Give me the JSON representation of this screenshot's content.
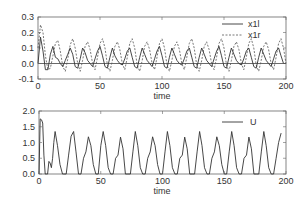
{
  "chart_data": [
    {
      "type": "line",
      "title": "",
      "xlabel": "time",
      "ylabel": "",
      "xlim": [
        0,
        200
      ],
      "ylim": [
        -0.1,
        0.3
      ],
      "x_ticks": [
        "0",
        "50",
        "100",
        "150",
        "200"
      ],
      "y_ticks": [
        "-0.1",
        "0.0",
        "0.1",
        "0.2",
        "0.3"
      ],
      "grid": false,
      "zero_line": true,
      "legend_position": "upper right",
      "series": [
        {
          "name": "x1l",
          "style": "solid",
          "x": [
            0,
            2,
            4,
            6,
            8,
            10,
            12,
            14,
            16,
            18,
            20,
            22,
            24,
            26,
            28,
            30,
            32,
            34,
            36,
            38,
            40,
            42,
            44,
            46,
            48,
            50,
            52,
            54,
            56,
            58,
            60,
            62,
            64,
            66,
            68,
            70,
            72,
            74,
            76,
            78,
            80,
            82,
            84,
            86,
            88,
            90,
            92,
            94,
            96,
            98,
            100,
            102,
            104,
            106,
            108,
            110,
            112,
            114,
            116,
            118,
            120,
            122,
            124,
            126,
            128,
            130,
            132,
            134,
            136,
            138,
            140,
            142,
            144,
            146,
            148,
            150,
            152,
            154,
            156,
            158,
            160,
            162,
            164,
            166,
            168,
            170,
            172,
            174,
            176,
            178,
            180,
            182,
            184,
            186,
            188,
            190,
            192,
            194,
            196,
            198,
            200
          ],
          "y": [
            0.0,
            0.17,
            0.08,
            -0.04,
            -0.04,
            0.06,
            0.11,
            0.04,
            0.03,
            0.0,
            -0.02,
            0.02,
            0.06,
            0.1,
            0.06,
            -0.02,
            -0.03,
            0.03,
            0.1,
            0.07,
            0.02,
            0.0,
            -0.02,
            0.03,
            0.08,
            0.11,
            0.05,
            -0.02,
            -0.03,
            0.04,
            0.1,
            0.05,
            0.02,
            0.0,
            -0.01,
            0.03,
            0.08,
            0.1,
            0.04,
            -0.02,
            -0.03,
            0.04,
            0.1,
            0.06,
            0.02,
            0.0,
            -0.02,
            0.03,
            0.08,
            0.11,
            0.05,
            -0.02,
            -0.03,
            0.04,
            0.1,
            0.06,
            0.02,
            0.0,
            -0.01,
            0.03,
            0.08,
            0.1,
            0.04,
            -0.02,
            -0.03,
            0.04,
            0.1,
            0.06,
            0.02,
            0.0,
            -0.02,
            0.03,
            0.08,
            0.11,
            0.05,
            -0.02,
            -0.03,
            0.04,
            0.1,
            0.06,
            0.02,
            0.0,
            -0.01,
            0.03,
            0.08,
            0.1,
            0.04,
            -0.02,
            -0.03,
            0.04,
            0.1,
            0.06,
            0.02,
            0.0,
            -0.02,
            0.03,
            0.08,
            0.1,
            0.05,
            0.0,
            0.0
          ]
        },
        {
          "name": "x1r",
          "style": "dashed",
          "x": [
            0,
            2,
            4,
            6,
            8,
            10,
            12,
            14,
            16,
            18,
            20,
            22,
            24,
            26,
            28,
            30,
            32,
            34,
            36,
            38,
            40,
            42,
            44,
            46,
            48,
            50,
            52,
            54,
            56,
            58,
            60,
            62,
            64,
            66,
            68,
            70,
            72,
            74,
            76,
            78,
            80,
            82,
            84,
            86,
            88,
            90,
            92,
            94,
            96,
            98,
            100,
            102,
            104,
            106,
            108,
            110,
            112,
            114,
            116,
            118,
            120,
            122,
            124,
            126,
            128,
            130,
            132,
            134,
            136,
            138,
            140,
            142,
            144,
            146,
            148,
            150,
            152,
            154,
            156,
            158,
            160,
            162,
            164,
            166,
            168,
            170,
            172,
            174,
            176,
            178,
            180,
            182,
            184,
            186,
            188,
            190,
            192,
            194,
            196,
            198,
            200
          ],
          "y": [
            0.1,
            0.25,
            0.2,
            0.05,
            -0.04,
            -0.03,
            0.05,
            0.13,
            0.15,
            0.08,
            -0.02,
            -0.05,
            0.03,
            0.12,
            0.16,
            0.1,
            0.0,
            -0.05,
            0.02,
            0.11,
            0.14,
            0.09,
            0.0,
            -0.04,
            0.04,
            0.13,
            0.16,
            0.1,
            -0.01,
            -0.05,
            0.02,
            0.11,
            0.14,
            0.09,
            0.0,
            -0.04,
            0.04,
            0.13,
            0.16,
            0.1,
            -0.01,
            -0.05,
            0.02,
            0.11,
            0.14,
            0.09,
            0.0,
            -0.04,
            0.04,
            0.13,
            0.16,
            0.1,
            -0.01,
            -0.05,
            0.02,
            0.11,
            0.14,
            0.09,
            0.0,
            -0.04,
            0.04,
            0.13,
            0.16,
            0.1,
            -0.01,
            -0.05,
            0.02,
            0.11,
            0.14,
            0.09,
            0.0,
            -0.04,
            0.04,
            0.13,
            0.16,
            0.1,
            -0.01,
            -0.05,
            0.02,
            0.11,
            0.14,
            0.09,
            0.0,
            -0.04,
            0.04,
            0.13,
            0.16,
            0.1,
            -0.01,
            -0.05,
            0.02,
            0.11,
            0.14,
            0.09,
            0.0,
            -0.04,
            0.04,
            0.13,
            0.16,
            0.1,
            0.0
          ]
        }
      ]
    },
    {
      "type": "line",
      "title": "",
      "xlabel": "time",
      "ylabel": "",
      "xlim": [
        0,
        200
      ],
      "ylim": [
        0.0,
        2.0
      ],
      "x_ticks": [
        "0",
        "50",
        "100",
        "150",
        "200"
      ],
      "y_ticks": [
        "0.0",
        "0.5",
        "1.0",
        "1.5",
        "2.0"
      ],
      "grid": false,
      "legend_position": "upper right",
      "series": [
        {
          "name": "U",
          "style": "solid",
          "x": [
            0,
            1,
            2,
            3,
            4,
            5,
            6,
            7,
            8,
            9,
            10,
            11,
            12,
            13,
            15,
            17,
            19,
            20,
            22,
            24,
            26,
            28,
            30,
            32,
            34,
            36,
            38,
            40,
            42,
            44,
            46,
            48,
            50,
            52,
            54,
            56,
            58,
            60,
            62,
            64,
            66,
            68,
            70,
            72,
            74,
            76,
            78,
            80,
            82,
            84,
            86,
            88,
            90,
            92,
            94,
            96,
            98,
            100,
            102,
            104,
            106,
            108,
            110,
            112,
            114,
            116,
            118,
            120,
            122,
            124,
            126,
            128,
            130,
            132,
            134,
            136,
            138,
            140,
            142,
            144,
            146,
            148,
            150,
            152,
            154,
            156,
            158,
            160,
            162,
            164,
            166,
            168,
            170,
            172,
            174,
            176,
            178,
            180,
            182,
            184,
            186,
            188,
            190,
            192,
            194,
            196,
            198,
            200
          ],
          "y": [
            0.0,
            1.75,
            1.72,
            1.62,
            0.6,
            0.0,
            0.0,
            0.0,
            0.4,
            0.35,
            0.2,
            0.5,
            1.0,
            1.35,
            0.9,
            0.3,
            0.0,
            0.0,
            0.0,
            0.6,
            1.2,
            1.35,
            0.7,
            0.0,
            0.0,
            0.5,
            0.7,
            1.18,
            0.9,
            0.3,
            0.0,
            0.0,
            0.9,
            1.35,
            0.9,
            0.2,
            0.0,
            0.0,
            0.5,
            0.6,
            1.17,
            0.8,
            0.0,
            0.0,
            0.0,
            0.7,
            1.35,
            0.9,
            0.2,
            0.0,
            0.0,
            0.5,
            0.7,
            1.18,
            0.9,
            0.3,
            0.0,
            0.0,
            0.7,
            1.35,
            0.9,
            0.2,
            0.0,
            0.0,
            0.5,
            0.6,
            1.17,
            0.8,
            0.0,
            0.0,
            0.0,
            0.7,
            1.35,
            0.9,
            0.2,
            0.0,
            0.0,
            0.5,
            0.7,
            1.18,
            0.9,
            0.3,
            0.0,
            0.0,
            0.7,
            1.35,
            0.9,
            0.2,
            0.0,
            0.0,
            0.5,
            0.6,
            1.17,
            0.8,
            0.0,
            0.0,
            0.0,
            0.7,
            1.35,
            0.9,
            0.2,
            0.0,
            0.0,
            0.5,
            1.0,
            1.3
          ]
        }
      ]
    }
  ],
  "plots": {
    "top": {
      "xlabel": "time",
      "legend": [
        "x1l",
        "x1r"
      ]
    },
    "bottom": {
      "xlabel": "time",
      "legend": [
        "U"
      ]
    }
  },
  "colors": {
    "line": "#333333",
    "axis": "#555555",
    "text": "#333333"
  }
}
